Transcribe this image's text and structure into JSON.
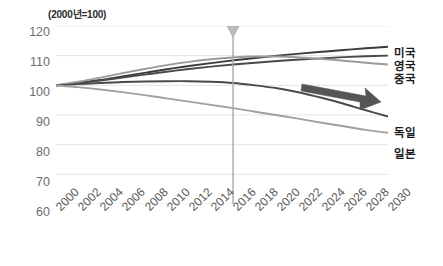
{
  "chart_data": {
    "type": "line",
    "title": "(2000년=100)",
    "xlabel": "",
    "ylabel": "",
    "xlim": [
      2000,
      2030
    ],
    "ylim": [
      60,
      120
    ],
    "grid": true,
    "legend_position": "right-inline",
    "x": [
      2000,
      2002,
      2004,
      2006,
      2008,
      2010,
      2012,
      2014,
      2016,
      2018,
      2020,
      2022,
      2024,
      2026,
      2028,
      2030
    ],
    "x_tick_labels": [
      "2000",
      "2002",
      "2004",
      "2006",
      "2008",
      "2010",
      "2012",
      "2014",
      "2016",
      "2018",
      "2020",
      "2022",
      "2024",
      "2026",
      "2028",
      "2030"
    ],
    "y_tick_labels": [
      "120",
      "110",
      "100",
      "90",
      "80",
      "70",
      "60"
    ],
    "y_ticks": [
      120,
      110,
      100,
      90,
      80,
      70,
      60
    ],
    "series": [
      {
        "name": "미국",
        "color": "#3a3a3a",
        "values": [
          100,
          100.8,
          101.8,
          103.0,
          104.2,
          105.4,
          106.5,
          107.5,
          108.4,
          109.2,
          110.0,
          110.7,
          111.3,
          111.9,
          112.5,
          113.0
        ]
      },
      {
        "name": "영국",
        "color": "#4a4a4a",
        "values": [
          100,
          100.7,
          101.6,
          102.6,
          103.6,
          104.6,
          105.5,
          106.3,
          107.0,
          107.6,
          108.2,
          108.7,
          109.1,
          109.5,
          109.8,
          110.0
        ]
      },
      {
        "name": "중국",
        "color": "#9a9a9a",
        "values": [
          100,
          101.2,
          102.6,
          104.1,
          105.5,
          106.8,
          107.9,
          108.8,
          109.4,
          109.7,
          109.7,
          109.4,
          108.9,
          108.3,
          107.6,
          107.0
        ]
      },
      {
        "name": "독일",
        "color": "#4a4a4a",
        "values": [
          100,
          100.4,
          100.8,
          101.1,
          101.3,
          101.4,
          101.4,
          101.2,
          100.8,
          100.0,
          99.0,
          97.6,
          95.8,
          93.8,
          91.6,
          89.5
        ]
      },
      {
        "name": "일본",
        "color": "#a0a0a0",
        "values": [
          100,
          99.4,
          98.6,
          97.7,
          96.7,
          95.6,
          94.5,
          93.4,
          92.3,
          91.1,
          89.9,
          88.7,
          87.4,
          86.2,
          85.0,
          84.0
        ]
      }
    ],
    "annotations": [
      {
        "name": "marker-line",
        "type": "vertical-marker",
        "x": 2016,
        "color": "#a8a8a8"
      },
      {
        "name": "trend-arrow",
        "type": "arrow",
        "direction": "right",
        "color": "#555555"
      }
    ]
  },
  "labels": {
    "usa": "미국",
    "uk": "영국",
    "china": "중국",
    "germany": "독일",
    "japan": "일본"
  }
}
